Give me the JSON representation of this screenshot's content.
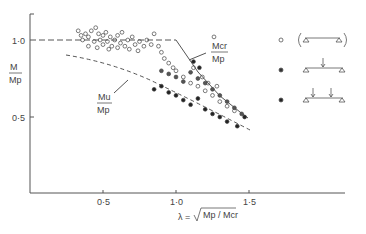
{
  "chart_data": {
    "type": "scatter",
    "title": "",
    "xlabel": "λ = √(Mp/Mcr)",
    "ylabel": "M/Mp",
    "xlim": [
      0,
      2.1
    ],
    "ylim": [
      0,
      1.15
    ],
    "x_ticks": [
      "0·5",
      "1·0",
      "1·5"
    ],
    "y_ticks": [
      "0·5",
      "1·0"
    ],
    "grid": false,
    "legend_position": "right",
    "annotations": [
      {
        "text_num": "Mcr",
        "text_den": "Mp",
        "target": "elastic critical curve"
      },
      {
        "text_num": "Mu",
        "text_den": "Mp",
        "target": "design curve"
      }
    ],
    "curves": [
      {
        "name": "Mcr/Mp plateau",
        "style": "dashed",
        "points": [
          [
            0,
            1.0
          ],
          [
            1.0,
            1.0
          ]
        ]
      },
      {
        "name": "Mcr/Mp",
        "style": "solid",
        "points": [
          [
            1.0,
            1.0
          ],
          [
            1.48,
            0.48
          ]
        ]
      },
      {
        "name": "Mu/Mp",
        "style": "dashed",
        "points": [
          [
            0.3,
            0.9
          ],
          [
            0.6,
            0.83
          ],
          [
            0.9,
            0.74
          ],
          [
            1.1,
            0.66
          ],
          [
            1.3,
            0.56
          ],
          [
            1.5,
            0.42
          ]
        ]
      }
    ],
    "series": [
      {
        "name": "uniform moment (end moments)",
        "marker": "open-circle",
        "points": [
          [
            0.33,
            1.06
          ],
          [
            0.35,
            1.03
          ],
          [
            0.36,
            1.0
          ],
          [
            0.38,
            1.04
          ],
          [
            0.4,
            1.02
          ],
          [
            0.42,
            1.06
          ],
          [
            0.44,
            0.99
          ],
          [
            0.45,
            1.08
          ],
          [
            0.47,
            1.04
          ],
          [
            0.48,
            1.0
          ],
          [
            0.5,
            0.97
          ],
          [
            0.5,
            1.03
          ],
          [
            0.52,
            1.05
          ],
          [
            0.53,
            0.99
          ],
          [
            0.55,
            1.02
          ],
          [
            0.56,
            0.96
          ],
          [
            0.58,
            1.0
          ],
          [
            0.6,
            1.03
          ],
          [
            0.62,
            0.98
          ],
          [
            0.63,
            1.05
          ],
          [
            0.65,
            0.96
          ],
          [
            0.67,
            1.0
          ],
          [
            0.7,
            1.02
          ],
          [
            0.72,
            0.97
          ],
          [
            0.75,
            0.99
          ],
          [
            0.78,
            0.96
          ],
          [
            0.8,
            1.0
          ],
          [
            0.83,
            0.97
          ],
          [
            0.85,
            1.04
          ],
          [
            0.88,
            0.96
          ],
          [
            0.9,
            0.92
          ],
          [
            0.92,
            0.88
          ],
          [
            0.95,
            0.85
          ],
          [
            0.98,
            0.82
          ],
          [
            1.0,
            0.8
          ],
          [
            1.05,
            0.76
          ],
          [
            1.1,
            0.72
          ],
          [
            1.15,
            0.7
          ],
          [
            1.2,
            0.67
          ],
          [
            1.25,
            0.64
          ],
          [
            1.3,
            0.6
          ],
          [
            1.35,
            0.57
          ],
          [
            1.4,
            0.54
          ],
          [
            1.12,
            0.82
          ],
          [
            1.18,
            0.76
          ],
          [
            1.22,
            0.72
          ],
          [
            1.28,
            0.7
          ],
          [
            0.4,
            0.96
          ],
          [
            0.46,
            0.95
          ],
          [
            0.54,
            0.94
          ],
          [
            0.6,
            0.95
          ],
          [
            0.68,
            0.94
          ],
          [
            0.74,
            0.93
          ],
          [
            1.26,
            1.02
          ]
        ]
      },
      {
        "name": "central point load",
        "marker": "half-filled",
        "points": [
          [
            0.9,
            0.8
          ],
          [
            0.95,
            0.78
          ],
          [
            1.0,
            0.76
          ],
          [
            1.05,
            0.73
          ],
          [
            1.1,
            0.79
          ],
          [
            1.15,
            0.75
          ],
          [
            1.2,
            0.72
          ],
          [
            1.25,
            0.68
          ],
          [
            1.3,
            0.64
          ],
          [
            1.35,
            0.6
          ],
          [
            1.4,
            0.56
          ],
          [
            1.45,
            0.52
          ]
        ]
      },
      {
        "name": "two point loads",
        "marker": "filled-circle",
        "points": [
          [
            0.85,
            0.68
          ],
          [
            0.9,
            0.7
          ],
          [
            0.95,
            0.66
          ],
          [
            1.0,
            0.64
          ],
          [
            1.05,
            0.61
          ],
          [
            1.1,
            0.58
          ],
          [
            1.15,
            0.62
          ],
          [
            1.2,
            0.55
          ],
          [
            1.25,
            0.52
          ],
          [
            1.3,
            0.5
          ],
          [
            1.35,
            0.47
          ],
          [
            1.42,
            0.44
          ],
          [
            1.47,
            0.5
          ],
          [
            1.12,
            0.86
          ],
          [
            1.16,
            0.82
          ]
        ]
      }
    ],
    "legend": [
      {
        "marker": "open-circle",
        "load_case": "beam with equal end moments"
      },
      {
        "marker": "half-filled",
        "load_case": "simply supported beam, central point load"
      },
      {
        "marker": "filled-circle",
        "load_case": "simply supported beam, two point loads"
      }
    ]
  },
  "labels": {
    "y_num": "M",
    "y_den": "Mp",
    "x_lambda": "λ =",
    "x_frac": "Mp / Mcr",
    "mcr_num": "Mcr",
    "mcr_den": "Mp",
    "mu_num": "Mu",
    "mu_den": "Mp",
    "tick_x_05": "0·5",
    "tick_x_10": "1·0",
    "tick_x_15": "1·5",
    "tick_y_05": "0·5",
    "tick_y_10": "1·0"
  },
  "colors": {
    "ink": "#333333",
    "background": "#ffffff"
  }
}
